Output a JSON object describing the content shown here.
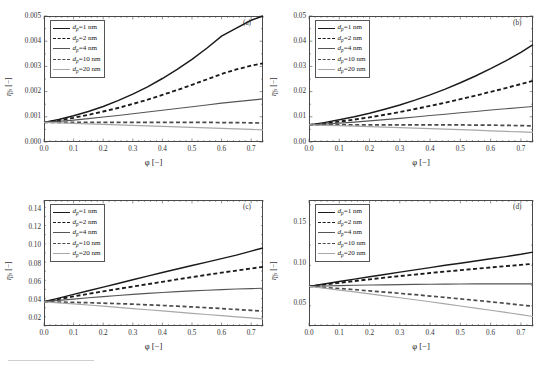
{
  "figure": {
    "kind": "multi-panel-line-chart",
    "rows": 2,
    "cols": 2,
    "background": "#ffffff",
    "axis_color": "#4a4a4a",
    "xlabel": "φ [−]",
    "ylabel": "η",
    "ylabel_sub": "fs",
    "ylabel_unit": " [−]"
  },
  "series_styles": [
    {
      "key": "dp1",
      "label_var": "d",
      "label_sub": "p",
      "label_val": "=1 nm",
      "color": "#1a1a1a",
      "dash": "none",
      "width": 1.45
    },
    {
      "key": "dp2",
      "label_var": "d",
      "label_sub": "p",
      "label_val": "=2 nm",
      "color": "#1a1a1a",
      "dash": "4,2.6",
      "width": 1.85
    },
    {
      "key": "dp4",
      "label_var": "d",
      "label_sub": "p",
      "label_val": "=4 nm",
      "color": "#555555",
      "dash": "none",
      "width": 1.15
    },
    {
      "key": "dp10",
      "label_var": "d",
      "label_sub": "p",
      "label_val": "=10 nm",
      "color": "#4a4a4a",
      "dash": "4,2.6",
      "width": 1.7
    },
    {
      "key": "dp20",
      "label_var": "d",
      "label_sub": "p",
      "label_val": "=20 nm",
      "color": "#a8a8a8",
      "dash": "none",
      "width": 1.2
    }
  ],
  "legend": {
    "entries": [
      "d_p =1 nm",
      "d_p =2 nm",
      "d_p =4 nm",
      "d_p =10 nm",
      "d_p =20 nm"
    ]
  },
  "chart_data": [
    {
      "panel": "(a)",
      "type": "line",
      "title": "",
      "xlabel": "φ [−]",
      "ylabel": "η_fs [−]",
      "xlim": [
        0.0,
        0.74
      ],
      "ylim": [
        0.0,
        0.005
      ],
      "xticks": [
        0.0,
        0.1,
        0.2,
        0.3,
        0.4,
        0.5,
        0.6,
        0.7
      ],
      "xticklabels": [
        "0.0",
        "0.1",
        "0.2",
        "0.3",
        "0.4",
        "0.5",
        "0.6",
        "0.7"
      ],
      "yticks": [
        0.0,
        0.001,
        0.002,
        0.003,
        0.004,
        0.005
      ],
      "yticklabels": [
        "0.000",
        "0.001",
        "0.002",
        "0.003",
        "0.004",
        "0.005"
      ],
      "grid": false,
      "legend_position": "upper-left",
      "x": [
        0.0,
        0.05,
        0.1,
        0.15,
        0.2,
        0.25,
        0.3,
        0.35,
        0.4,
        0.45,
        0.5,
        0.55,
        0.6,
        0.65,
        0.7,
        0.74
      ],
      "series": [
        {
          "name": "d_p =1 nm",
          "values": [
            0.00078,
            0.00089,
            0.00104,
            0.00121,
            0.00141,
            0.00164,
            0.0019,
            0.00219,
            0.00252,
            0.00288,
            0.00328,
            0.00372,
            0.0042,
            0.00452,
            0.00483,
            0.005
          ]
        },
        {
          "name": "d_p =2 nm",
          "values": [
            0.00078,
            0.00086,
            0.00096,
            0.00108,
            0.00121,
            0.00135,
            0.00151,
            0.00168,
            0.00187,
            0.00206,
            0.00227,
            0.00248,
            0.0027,
            0.00288,
            0.00303,
            0.00312
          ]
        },
        {
          "name": "d_p =4 nm",
          "values": [
            0.00078,
            0.00082,
            0.00087,
            0.00093,
            0.00099,
            0.00105,
            0.00112,
            0.00119,
            0.00126,
            0.00133,
            0.0014,
            0.00147,
            0.00154,
            0.0016,
            0.00166,
            0.00171
          ]
        },
        {
          "name": "d_p =10 nm",
          "values": [
            0.00078,
            0.00078,
            0.00078,
            0.00078,
            0.00078,
            0.00078,
            0.00078,
            0.00078,
            0.00078,
            0.00078,
            0.00078,
            0.00078,
            0.00077,
            0.00077,
            0.00076,
            0.00075
          ]
        },
        {
          "name": "d_p =20 nm",
          "values": [
            0.00078,
            0.00076,
            0.00074,
            0.00072,
            0.0007,
            0.00068,
            0.00066,
            0.00064,
            0.00062,
            0.0006,
            0.00058,
            0.00056,
            0.00054,
            0.00052,
            0.0005,
            0.00048
          ]
        }
      ]
    },
    {
      "panel": "(b)",
      "type": "line",
      "title": "",
      "xlabel": "φ [−]",
      "ylabel": "η_fs [−]",
      "xlim": [
        0.0,
        0.74
      ],
      "ylim": [
        0.0,
        0.05
      ],
      "xticks": [
        0.0,
        0.1,
        0.2,
        0.3,
        0.4,
        0.5,
        0.6,
        0.7
      ],
      "xticklabels": [
        "0.0",
        "0.1",
        "0.2",
        "0.3",
        "0.4",
        "0.5",
        "0.6",
        "0.7"
      ],
      "yticks": [
        0.0,
        0.01,
        0.02,
        0.03,
        0.04,
        0.05
      ],
      "yticklabels": [
        "0.00",
        "0.01",
        "0.02",
        "0.03",
        "0.04",
        "0.05"
      ],
      "grid": false,
      "legend_position": "upper-left",
      "x": [
        0.0,
        0.05,
        0.1,
        0.15,
        0.2,
        0.25,
        0.3,
        0.35,
        0.4,
        0.45,
        0.5,
        0.55,
        0.6,
        0.65,
        0.7,
        0.74
      ],
      "series": [
        {
          "name": "d_p =1 nm",
          "values": [
            0.0068,
            0.0077,
            0.0088,
            0.01,
            0.0114,
            0.013,
            0.0147,
            0.0166,
            0.0187,
            0.021,
            0.0235,
            0.0262,
            0.0291,
            0.0322,
            0.0356,
            0.0386
          ]
        },
        {
          "name": "d_p =2 nm",
          "values": [
            0.0068,
            0.0074,
            0.0081,
            0.0089,
            0.0098,
            0.0108,
            0.0119,
            0.0131,
            0.0143,
            0.0156,
            0.017,
            0.0184,
            0.0199,
            0.0214,
            0.023,
            0.0243
          ]
        },
        {
          "name": "d_p =4 nm",
          "values": [
            0.0068,
            0.0071,
            0.0075,
            0.0079,
            0.0084,
            0.0089,
            0.0094,
            0.0099,
            0.0105,
            0.011,
            0.0116,
            0.0121,
            0.0127,
            0.0132,
            0.0137,
            0.0141
          ]
        },
        {
          "name": "d_p =10 nm",
          "values": [
            0.0068,
            0.0068,
            0.0068,
            0.0068,
            0.0068,
            0.0068,
            0.0068,
            0.0068,
            0.0068,
            0.0068,
            0.0068,
            0.0067,
            0.0067,
            0.0066,
            0.0065,
            0.0064
          ]
        },
        {
          "name": "d_p =20 nm",
          "values": [
            0.0068,
            0.0066,
            0.0065,
            0.0063,
            0.0061,
            0.0059,
            0.0057,
            0.0055,
            0.0053,
            0.0051,
            0.0049,
            0.0047,
            0.0044,
            0.0042,
            0.004,
            0.0038
          ]
        }
      ]
    },
    {
      "panel": "(c)",
      "type": "line",
      "title": "",
      "xlabel": "φ [−]",
      "ylabel": "η_fs [−]",
      "xlim": [
        0.0,
        0.74
      ],
      "ylim": [
        0.012,
        0.15
      ],
      "xticks": [
        0.0,
        0.1,
        0.2,
        0.3,
        0.4,
        0.5,
        0.6,
        0.7
      ],
      "xticklabels": [
        "0.0",
        "0.1",
        "0.2",
        "0.3",
        "0.4",
        "0.5",
        "0.6",
        "0.7"
      ],
      "yticks": [
        0.02,
        0.04,
        0.06,
        0.08,
        0.1,
        0.12,
        0.14
      ],
      "yticklabels": [
        "0.02",
        "0.04",
        "0.06",
        "0.08",
        "0.10",
        "0.12",
        "0.14"
      ],
      "grid": false,
      "legend_position": "upper-left",
      "x": [
        0.0,
        0.05,
        0.1,
        0.15,
        0.2,
        0.25,
        0.3,
        0.35,
        0.4,
        0.45,
        0.5,
        0.55,
        0.6,
        0.65,
        0.7,
        0.74
      ],
      "series": [
        {
          "name": "d_p =1 nm",
          "values": [
            0.0385,
            0.0425,
            0.0466,
            0.0506,
            0.0546,
            0.0586,
            0.0626,
            0.0666,
            0.0706,
            0.0744,
            0.0782,
            0.082,
            0.0858,
            0.0896,
            0.094,
            0.0975
          ]
        },
        {
          "name": "d_p =2 nm",
          "values": [
            0.0385,
            0.0415,
            0.0444,
            0.0472,
            0.0499,
            0.0526,
            0.0552,
            0.0578,
            0.0604,
            0.063,
            0.0655,
            0.068,
            0.0704,
            0.0727,
            0.075,
            0.0768
          ]
        },
        {
          "name": "d_p =4 nm",
          "values": [
            0.0385,
            0.04,
            0.0415,
            0.0429,
            0.0442,
            0.0454,
            0.0466,
            0.0477,
            0.0487,
            0.0496,
            0.0504,
            0.0512,
            0.0519,
            0.0525,
            0.053,
            0.0533
          ]
        },
        {
          "name": "d_p =10 nm",
          "values": [
            0.0385,
            0.0382,
            0.0379,
            0.0375,
            0.037,
            0.0365,
            0.0359,
            0.0352,
            0.0345,
            0.0337,
            0.0329,
            0.032,
            0.0311,
            0.0301,
            0.0291,
            0.0283
          ]
        },
        {
          "name": "d_p =20 nm",
          "values": [
            0.0385,
            0.0374,
            0.0362,
            0.035,
            0.0337,
            0.0324,
            0.0311,
            0.0298,
            0.0285,
            0.0272,
            0.0259,
            0.0246,
            0.0233,
            0.0221,
            0.0208,
            0.0198
          ]
        }
      ]
    },
    {
      "panel": "(d)",
      "type": "line",
      "title": "",
      "xlabel": "φ [−]",
      "ylabel": "η_fs [−]",
      "xlim": [
        0.0,
        0.74
      ],
      "ylim": [
        0.022,
        0.178
      ],
      "xticks": [
        0.0,
        0.1,
        0.2,
        0.3,
        0.4,
        0.5,
        0.6,
        0.7
      ],
      "xticklabels": [
        "0.0",
        "0.1",
        "0.2",
        "0.3",
        "0.4",
        "0.5",
        "0.6",
        "0.7"
      ],
      "yticks": [
        0.05,
        0.1,
        0.15
      ],
      "yticklabels": [
        "0.05",
        "0.10",
        "0.15"
      ],
      "grid": false,
      "legend_position": "upper-left",
      "x": [
        0.0,
        0.05,
        0.1,
        0.15,
        0.2,
        0.25,
        0.3,
        0.35,
        0.4,
        0.45,
        0.5,
        0.55,
        0.6,
        0.65,
        0.7,
        0.74
      ],
      "series": [
        {
          "name": "d_p =1 nm",
          "values": [
            0.071,
            0.074,
            0.077,
            0.08,
            0.0829,
            0.0858,
            0.0887,
            0.0915,
            0.0943,
            0.0971,
            0.0998,
            0.1025,
            0.1052,
            0.1079,
            0.1108,
            0.1135
          ]
        },
        {
          "name": "d_p =2 nm",
          "values": [
            0.071,
            0.0733,
            0.0755,
            0.0777,
            0.0798,
            0.0818,
            0.0838,
            0.0857,
            0.0876,
            0.0894,
            0.0911,
            0.0928,
            0.0945,
            0.0961,
            0.0977,
            0.099
          ]
        },
        {
          "name": "d_p =4 nm",
          "values": [
            0.071,
            0.0715,
            0.072,
            0.0724,
            0.0727,
            0.073,
            0.0733,
            0.0735,
            0.0737,
            0.0739,
            0.074,
            0.0741,
            0.0742,
            0.0742,
            0.0742,
            0.0742
          ]
        },
        {
          "name": "d_p =10 nm",
          "values": [
            0.071,
            0.0697,
            0.0684,
            0.067,
            0.0655,
            0.064,
            0.0624,
            0.0608,
            0.0591,
            0.0574,
            0.0556,
            0.0538,
            0.0519,
            0.05,
            0.048,
            0.0464
          ]
        },
        {
          "name": "d_p =20 nm",
          "values": [
            0.071,
            0.0688,
            0.0665,
            0.0642,
            0.0618,
            0.0594,
            0.057,
            0.0545,
            0.052,
            0.0494,
            0.0468,
            0.0442,
            0.0415,
            0.0388,
            0.036,
            0.0338
          ]
        }
      ]
    }
  ]
}
